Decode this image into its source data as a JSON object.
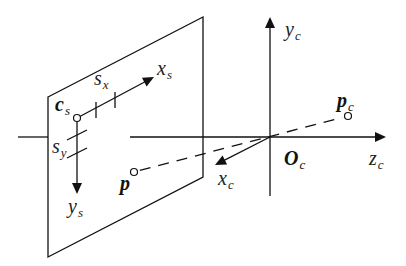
{
  "diagram": {
    "colors": {
      "line": "#111111",
      "background": "#ffffff",
      "text": "#222222"
    },
    "image_plane": {
      "corners": [
        [
          48,
          97
        ],
        [
          203,
          17
        ],
        [
          203,
          177
        ],
        [
          48,
          257
        ]
      ]
    },
    "optical_axis": {
      "left_stub": [
        [
          18,
          137
        ],
        [
          48,
          137
        ]
      ],
      "main": [
        [
          130,
          137
        ],
        [
          385,
          137
        ]
      ]
    },
    "camera_axes": {
      "origin": [
        270,
        137
      ],
      "y_axis": {
        "from": [
          270,
          196
        ],
        "to": [
          270,
          17
        ]
      },
      "z_axis": {
        "from": [
          130,
          137
        ],
        "to": [
          386,
          137
        ]
      },
      "x_axis": {
        "from": [
          270,
          137
        ],
        "to": [
          215,
          165
        ]
      }
    },
    "image_axes": {
      "origin": [
        77,
        118
      ],
      "x_axis": {
        "from": [
          77,
          118
        ],
        "to": [
          154,
          77
        ]
      },
      "y_axis": {
        "from": [
          77,
          118
        ],
        "to": [
          77,
          194
        ]
      },
      "sx_ticks": [
        [
          [
            96,
            102
          ],
          [
            96,
            118
          ]
        ],
        [
          [
            115,
            92
          ],
          [
            115,
            108
          ]
        ]
      ],
      "sy_ticks": [
        [
          [
            67,
            140
          ],
          [
            87,
            130
          ]
        ],
        [
          [
            67,
            158
          ],
          [
            87,
            148
          ]
        ]
      ]
    },
    "projection_ray": {
      "from": [
        134,
        172
      ],
      "to": [
        348,
        116
      ]
    },
    "points": {
      "p": [
        134,
        172
      ],
      "p_c": [
        348,
        116
      ],
      "c_s": [
        77,
        118
      ]
    },
    "labels": {
      "c_s": {
        "main": "c",
        "sub": "s",
        "pos": [
          55,
          94
        ],
        "bold": true
      },
      "s_x": {
        "main": "s",
        "sub": "x",
        "pos": [
          94,
          68
        ],
        "bold": false
      },
      "x_s": {
        "main": "x",
        "sub": "s",
        "pos": [
          157,
          58
        ],
        "bold": false
      },
      "s_y": {
        "main": "s",
        "sub": "y",
        "pos": [
          52,
          136
        ],
        "bold": false
      },
      "y_s": {
        "main": "y",
        "sub": "s",
        "pos": [
          68,
          196
        ],
        "bold": false
      },
      "p": {
        "main": "p",
        "sub": "",
        "pos": [
          120,
          173
        ],
        "bold": true
      },
      "p_c": {
        "main": "p",
        "sub": "c",
        "pos": [
          337,
          90
        ],
        "bold": true
      },
      "y_c": {
        "main": "y",
        "sub": "c",
        "pos": [
          285,
          19
        ],
        "bold": false
      },
      "x_c": {
        "main": "x",
        "sub": "c",
        "pos": [
          218,
          168
        ],
        "bold": false
      },
      "O_c": {
        "main": "O",
        "sub": "c",
        "pos": [
          284,
          148
        ],
        "bold": true
      },
      "z_c": {
        "main": "z",
        "sub": "c",
        "pos": [
          369,
          148
        ],
        "bold": false
      }
    }
  }
}
